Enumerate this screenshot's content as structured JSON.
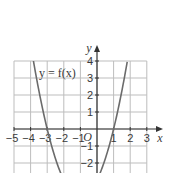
{
  "chart_data": {
    "type": "line",
    "title": "",
    "xlabel": "x",
    "ylabel": "y",
    "origin_label": "O",
    "xlim": [
      -5,
      3
    ],
    "ylim": [
      -2.6,
      4
    ],
    "grid": true,
    "x_ticks": [
      -5,
      -4,
      -3,
      -2,
      -1,
      1,
      2,
      3
    ],
    "x_tick_labels": [
      "−5",
      "−4",
      "−3",
      "−2",
      "−1",
      "1",
      "2",
      "3"
    ],
    "y_ticks": [
      -2,
      -1,
      1,
      2,
      3,
      4
    ],
    "y_tick_labels": [
      "−2",
      "−1",
      "1",
      "2",
      "3",
      "4"
    ],
    "series": [
      {
        "name": "y = f(x)",
        "function": "(x+3)(x-1)",
        "roots": [
          -3,
          1
        ],
        "x": [
          -3.83,
          -3.5,
          -3,
          -2.5,
          -2,
          0,
          0.5,
          1,
          1.5,
          1.83
        ],
        "y": [
          4,
          2.25,
          0,
          -1.75,
          -3,
          -3,
          -1.75,
          0,
          2.25,
          4
        ]
      }
    ],
    "annotations": [
      {
        "text": "y = f(x)",
        "x": -3.3,
        "y": 3.3
      }
    ],
    "colors": {
      "curve": "#6b6b6b",
      "grid": "#bdbdbd",
      "axis": "#333333"
    }
  }
}
